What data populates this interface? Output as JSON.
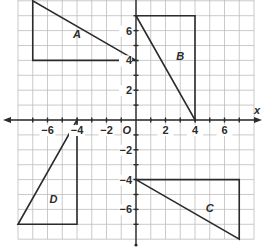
{
  "diagram": {
    "title": "",
    "axes": {
      "x_label": "x",
      "origin_label": "O",
      "x_range": [
        -8,
        8
      ],
      "y_range": [
        -8,
        8
      ],
      "x_ticks": [
        {
          "value": -6,
          "label": "−6"
        },
        {
          "value": -4,
          "label": "−4"
        },
        {
          "value": -2,
          "label": "−2"
        },
        {
          "value": 2,
          "label": "2"
        },
        {
          "value": 4,
          "label": "4"
        },
        {
          "value": 6,
          "label": "6"
        }
      ],
      "y_ticks": [
        {
          "value": 6,
          "label": "6"
        },
        {
          "value": 4,
          "label": "4"
        },
        {
          "value": 2,
          "label": "2"
        },
        {
          "value": -2,
          "label": "−2"
        },
        {
          "value": -4,
          "label": "−4"
        },
        {
          "value": -6,
          "label": "−6"
        }
      ]
    },
    "shapes": [
      {
        "name": "A",
        "vertices": [
          [
            -7,
            8
          ],
          [
            -7,
            4
          ],
          [
            0,
            4
          ]
        ],
        "label_pos": [
          -4,
          5.8
        ]
      },
      {
        "name": "B",
        "vertices": [
          [
            0,
            7
          ],
          [
            4,
            7
          ],
          [
            4,
            0
          ]
        ],
        "label_pos": [
          3,
          4.3
        ]
      },
      {
        "name": "C",
        "vertices": [
          [
            0,
            -4
          ],
          [
            7,
            -4
          ],
          [
            7,
            -8
          ]
        ],
        "label_pos": [
          5,
          -5.9
        ]
      },
      {
        "name": "D",
        "vertices": [
          [
            -4,
            0
          ],
          [
            -4,
            -7
          ],
          [
            -8,
            -7
          ]
        ],
        "label_pos": [
          -5.6,
          -5.3
        ]
      }
    ],
    "colors": {
      "grid": "#bdbdbd",
      "ink": "#2b2b2b",
      "background": "#ffffff"
    }
  }
}
